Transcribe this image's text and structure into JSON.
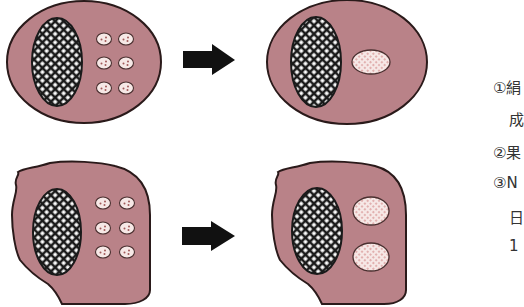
{
  "colors": {
    "cytoplasm": "#b98288",
    "outline": "#2a1a1a",
    "nucleus_hatch": "#1a1a1a",
    "nucleus_holes": "#ffffff",
    "granule_fill": "#f6e8e6",
    "granule_dot": "#c86a6a",
    "arrow": "#111111",
    "text": "#333333"
  },
  "panels": [
    {
      "id": "top-before",
      "shape": "ellipse",
      "granules": "six small vesicles"
    },
    {
      "id": "top-after",
      "shape": "ellipse",
      "granules": "one large pink oval"
    },
    {
      "id": "bottom-before",
      "shape": "irregular",
      "granules": "six small vesicles"
    },
    {
      "id": "bottom-after",
      "shape": "irregular",
      "granules": "two large pink ovals"
    }
  ],
  "arrows": [
    {
      "direction": "right"
    },
    {
      "direction": "right"
    }
  ],
  "notes": [
    {
      "text": "①絹",
      "x": 493,
      "y": 76
    },
    {
      "text": "成",
      "x": 509,
      "y": 108
    },
    {
      "text": "②果",
      "x": 493,
      "y": 141
    },
    {
      "text": "③N",
      "x": 493,
      "y": 174
    },
    {
      "text": "日",
      "x": 509,
      "y": 206
    },
    {
      "text": "1",
      "x": 509,
      "y": 237
    }
  ]
}
